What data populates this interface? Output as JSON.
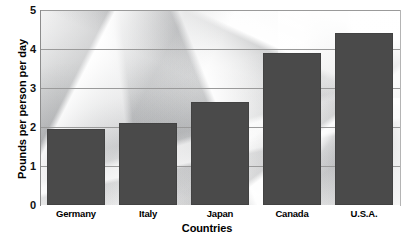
{
  "chart_data": {
    "type": "bar",
    "title": "",
    "categories": [
      "Germany",
      "Italy",
      "Japan",
      "Canada",
      "U.S.A."
    ],
    "values": [
      1.95,
      2.1,
      2.65,
      3.9,
      4.4
    ],
    "xlabel": "Countries",
    "ylabel": "Pounds per person per day",
    "ylim": [
      0,
      5
    ],
    "ytick_labels": [
      "5",
      "4",
      "3",
      "2",
      "1",
      "0"
    ],
    "ytick_values": [
      5,
      4,
      3,
      2,
      1,
      0
    ],
    "grid": true,
    "legend": null,
    "bar_color": "#4a4a4a",
    "gridline_color": "#9a9a9a",
    "background": "crumpled-paper-photo-texture"
  }
}
